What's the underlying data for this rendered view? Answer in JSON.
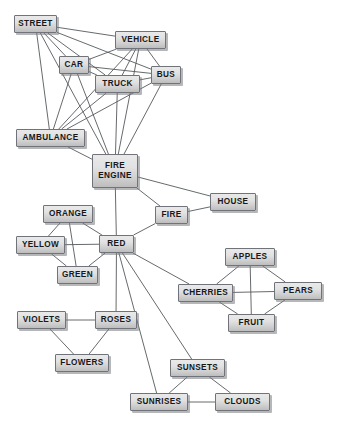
{
  "diagram": {
    "type": "node-link-graph",
    "width": 338,
    "height": 425,
    "colors": {
      "background": "#ffffff",
      "node_fill_light": "#e9e9e9",
      "node_fill_dark": "#bdbdbd",
      "node_border": "#70747a",
      "node_text": "#16181a",
      "edge": "#55595c",
      "shadow": "#787c80"
    },
    "nodes": [
      {
        "id": "street",
        "label": "STREET",
        "x": 14,
        "y": 15,
        "w": 43,
        "h": 18
      },
      {
        "id": "vehicle",
        "label": "VEHICLE",
        "x": 115,
        "y": 31,
        "w": 51,
        "h": 18
      },
      {
        "id": "car",
        "label": "CAR",
        "x": 59,
        "y": 56,
        "w": 30,
        "h": 18
      },
      {
        "id": "bus",
        "label": "BUS",
        "x": 151,
        "y": 66,
        "w": 30,
        "h": 18
      },
      {
        "id": "truck",
        "label": "TRUCK",
        "x": 95,
        "y": 75,
        "w": 45,
        "h": 18
      },
      {
        "id": "ambulance",
        "label": "AMBULANCE",
        "x": 16,
        "y": 129,
        "w": 69,
        "h": 18
      },
      {
        "id": "fire_engine",
        "label": "FIRE\nENGINE",
        "x": 92,
        "y": 154,
        "w": 46,
        "h": 34
      },
      {
        "id": "house",
        "label": "HOUSE",
        "x": 210,
        "y": 193,
        "w": 46,
        "h": 18
      },
      {
        "id": "fire",
        "label": "FIRE",
        "x": 155,
        "y": 206,
        "w": 33,
        "h": 18
      },
      {
        "id": "orange",
        "label": "ORANGE",
        "x": 43,
        "y": 205,
        "w": 50,
        "h": 18
      },
      {
        "id": "yellow",
        "label": "YELLOW",
        "x": 16,
        "y": 236,
        "w": 49,
        "h": 18
      },
      {
        "id": "red",
        "label": "RED",
        "x": 99,
        "y": 235,
        "w": 35,
        "h": 18
      },
      {
        "id": "apples",
        "label": "APPLES",
        "x": 225,
        "y": 248,
        "w": 50,
        "h": 18
      },
      {
        "id": "green",
        "label": "GREEN",
        "x": 57,
        "y": 266,
        "w": 41,
        "h": 18
      },
      {
        "id": "cherries",
        "label": "CHERRIES",
        "x": 178,
        "y": 284,
        "w": 55,
        "h": 18
      },
      {
        "id": "pears",
        "label": "PEARS",
        "x": 274,
        "y": 282,
        "w": 48,
        "h": 18
      },
      {
        "id": "violets",
        "label": "VIOLETS",
        "x": 17,
        "y": 311,
        "w": 49,
        "h": 18
      },
      {
        "id": "roses",
        "label": "ROSES",
        "x": 95,
        "y": 311,
        "w": 42,
        "h": 18
      },
      {
        "id": "fruit",
        "label": "FRUIT",
        "x": 228,
        "y": 314,
        "w": 47,
        "h": 18
      },
      {
        "id": "flowers",
        "label": "FLOWERS",
        "x": 55,
        "y": 354,
        "w": 54,
        "h": 18
      },
      {
        "id": "sunsets",
        "label": "SUNSETS",
        "x": 170,
        "y": 359,
        "w": 55,
        "h": 18
      },
      {
        "id": "sunrises",
        "label": "SUNRISES",
        "x": 130,
        "y": 393,
        "w": 58,
        "h": 18
      },
      {
        "id": "clouds",
        "label": "CLOUDS",
        "x": 215,
        "y": 393,
        "w": 55,
        "h": 18
      }
    ],
    "edges": [
      {
        "from": "street",
        "to": "vehicle"
      },
      {
        "from": "street",
        "to": "car"
      },
      {
        "from": "street",
        "to": "truck"
      },
      {
        "from": "street",
        "to": "bus"
      },
      {
        "from": "street",
        "to": "ambulance"
      },
      {
        "from": "street",
        "to": "fire_engine"
      },
      {
        "from": "vehicle",
        "to": "car"
      },
      {
        "from": "vehicle",
        "to": "truck"
      },
      {
        "from": "vehicle",
        "to": "bus"
      },
      {
        "from": "vehicle",
        "to": "ambulance"
      },
      {
        "from": "vehicle",
        "to": "fire_engine"
      },
      {
        "from": "car",
        "to": "truck"
      },
      {
        "from": "car",
        "to": "bus"
      },
      {
        "from": "car",
        "to": "ambulance"
      },
      {
        "from": "car",
        "to": "fire_engine"
      },
      {
        "from": "truck",
        "to": "bus"
      },
      {
        "from": "truck",
        "to": "ambulance"
      },
      {
        "from": "truck",
        "to": "fire_engine"
      },
      {
        "from": "bus",
        "to": "ambulance"
      },
      {
        "from": "bus",
        "to": "fire_engine"
      },
      {
        "from": "ambulance",
        "to": "fire_engine"
      },
      {
        "from": "fire_engine",
        "to": "fire"
      },
      {
        "from": "fire_engine",
        "to": "house"
      },
      {
        "from": "fire_engine",
        "to": "red"
      },
      {
        "from": "fire",
        "to": "house"
      },
      {
        "from": "fire",
        "to": "red"
      },
      {
        "from": "orange",
        "to": "yellow"
      },
      {
        "from": "orange",
        "to": "red"
      },
      {
        "from": "orange",
        "to": "green"
      },
      {
        "from": "yellow",
        "to": "red"
      },
      {
        "from": "yellow",
        "to": "green"
      },
      {
        "from": "red",
        "to": "green"
      },
      {
        "from": "red",
        "to": "roses"
      },
      {
        "from": "red",
        "to": "cherries"
      },
      {
        "from": "red",
        "to": "sunsets"
      },
      {
        "from": "red",
        "to": "sunrises"
      },
      {
        "from": "apples",
        "to": "cherries"
      },
      {
        "from": "apples",
        "to": "pears"
      },
      {
        "from": "apples",
        "to": "fruit"
      },
      {
        "from": "cherries",
        "to": "pears"
      },
      {
        "from": "cherries",
        "to": "fruit"
      },
      {
        "from": "pears",
        "to": "fruit"
      },
      {
        "from": "violets",
        "to": "roses"
      },
      {
        "from": "violets",
        "to": "flowers"
      },
      {
        "from": "roses",
        "to": "flowers"
      },
      {
        "from": "sunsets",
        "to": "sunrises"
      },
      {
        "from": "sunsets",
        "to": "clouds"
      },
      {
        "from": "sunrises",
        "to": "clouds"
      }
    ]
  }
}
